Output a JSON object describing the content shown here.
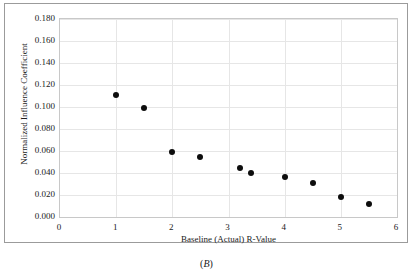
{
  "figure": {
    "caption_open": "(",
    "caption_label": "B",
    "caption_close": ")"
  },
  "chart_data": {
    "type": "scatter",
    "title": "",
    "xlabel": "Baseline (Actual) R-Value",
    "ylabel": "Normalized Influence Coefficient",
    "xlim": [
      0,
      6
    ],
    "ylim": [
      0,
      0.18
    ],
    "grid": true,
    "legend": null,
    "marker": {
      "shape": "circle",
      "color": "#0d0d0d",
      "size_px": 6
    },
    "xticks": [
      0,
      1,
      2,
      3,
      4,
      5,
      6
    ],
    "xtick_labels": [
      "0",
      "1",
      "2",
      "3",
      "4",
      "5",
      "6"
    ],
    "yticks": [
      0.0,
      0.02,
      0.04,
      0.06,
      0.08,
      0.1,
      0.12,
      0.14,
      0.16,
      0.18
    ],
    "ytick_labels": [
      "0.000",
      "0.020",
      "0.040",
      "0.060",
      "0.080",
      "0.100",
      "0.120",
      "0.140",
      "0.160",
      "0.180"
    ],
    "points": [
      {
        "x": 1.0,
        "y": 0.111
      },
      {
        "x": 1.5,
        "y": 0.099
      },
      {
        "x": 2.0,
        "y": 0.059
      },
      {
        "x": 2.5,
        "y": 0.055
      },
      {
        "x": 3.2,
        "y": 0.045
      },
      {
        "x": 3.4,
        "y": 0.04
      },
      {
        "x": 4.0,
        "y": 0.036
      },
      {
        "x": 4.5,
        "y": 0.031
      },
      {
        "x": 5.0,
        "y": 0.018
      },
      {
        "x": 5.5,
        "y": 0.012
      }
    ]
  }
}
